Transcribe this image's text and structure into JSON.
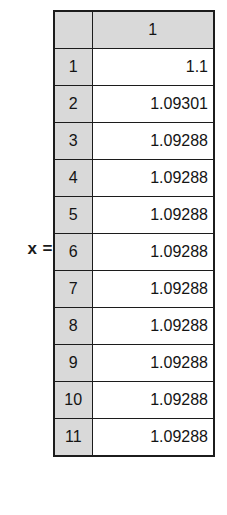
{
  "equation": {
    "variable_label": "x ="
  },
  "matrix": {
    "corner_label": "",
    "column_headers": [
      "1"
    ],
    "row_indices": [
      "1",
      "2",
      "3",
      "4",
      "5",
      "6",
      "7",
      "8",
      "9",
      "10",
      "11"
    ],
    "rows": [
      {
        "index": "1",
        "values": [
          "1.1"
        ]
      },
      {
        "index": "2",
        "values": [
          "1.09301"
        ]
      },
      {
        "index": "3",
        "values": [
          "1.09288"
        ]
      },
      {
        "index": "4",
        "values": [
          "1.09288"
        ]
      },
      {
        "index": "5",
        "values": [
          "1.09288"
        ]
      },
      {
        "index": "6",
        "values": [
          "1.09288"
        ]
      },
      {
        "index": "7",
        "values": [
          "1.09288"
        ]
      },
      {
        "index": "8",
        "values": [
          "1.09288"
        ]
      },
      {
        "index": "9",
        "values": [
          "1.09288"
        ]
      },
      {
        "index": "10",
        "values": [
          "1.09288"
        ]
      },
      {
        "index": "11",
        "values": [
          "1.09288"
        ]
      }
    ]
  },
  "colors": {
    "header_gray": "#d9d9d9",
    "border": "#1c1c1c",
    "text": "#141414",
    "background": "#ffffff"
  }
}
